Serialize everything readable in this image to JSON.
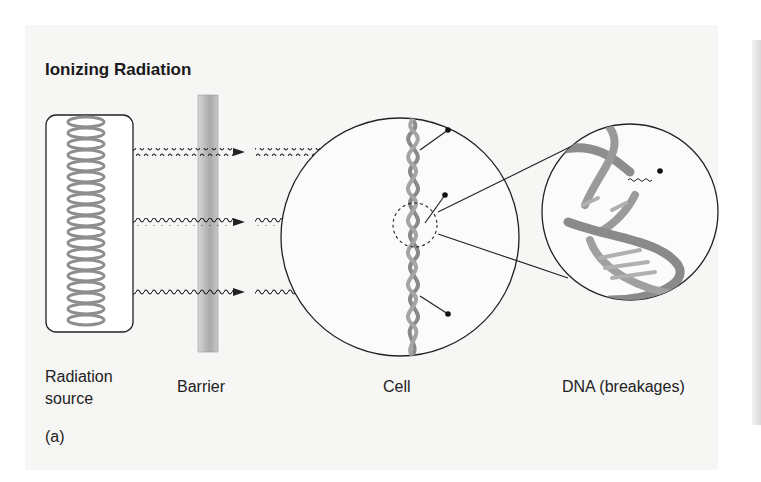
{
  "figure": {
    "title": "Ionizing Radiation",
    "panel_label": "(a)",
    "labels": {
      "source_line1": "Radiation",
      "source_line2": "source",
      "barrier": "Barrier",
      "cell": "Cell",
      "dna": "DNA (breakages)"
    },
    "components": [
      {
        "id": "radiation-source",
        "depiction": "coiled-spring-in-rounded-box"
      },
      {
        "id": "barrier",
        "depiction": "vertical-gray-bar"
      },
      {
        "id": "cell",
        "depiction": "circle-with-dna-helix"
      },
      {
        "id": "dna-magnified",
        "depiction": "zoomed-circle-broken-double-helix"
      }
    ],
    "rays": {
      "count": 3,
      "style": "wavy-arrow"
    },
    "colors": {
      "background": "#f6f6f5",
      "line": "#222222",
      "helix": "#8a8a8a",
      "barrier": "#b9b9b9"
    }
  }
}
